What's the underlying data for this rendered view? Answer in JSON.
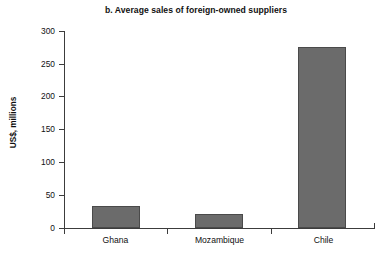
{
  "chart_data": {
    "type": "bar",
    "title": "b. Average sales of foreign-owned suppliers",
    "xlabel": "",
    "ylabel": "US$, millions",
    "categories": [
      "Ghana",
      "Mozambique",
      "Chile"
    ],
    "values": [
      33,
      21,
      275
    ],
    "ylim": [
      0,
      300
    ],
    "yticks": [
      0,
      50,
      100,
      150,
      200,
      250,
      300
    ],
    "ytick_labels": [
      "0",
      "50",
      "100",
      "150",
      "200",
      "250",
      "300"
    ],
    "grid": false,
    "legend": "none",
    "series": [
      {
        "name": "Average sales",
        "values": [
          33,
          21,
          275
        ]
      }
    ],
    "bar_color": "#6b6b6b",
    "bar_edge_color": "#4a4a4a",
    "axis_color": "#3c3c3c",
    "background": "#ffffff"
  }
}
